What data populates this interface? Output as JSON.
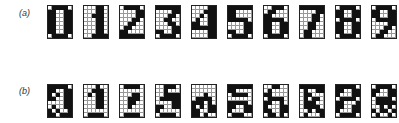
{
  "rows": [
    {
      "label": "(a)",
      "glyphs": [
        {
          "digit": "0",
          "grid": [
            "011110",
            "110011",
            "110011",
            "110011",
            "110011",
            "110011",
            "110011",
            "011110"
          ]
        },
        {
          "digit": "1",
          "grid": [
            "000110",
            "000110",
            "001110",
            "000110",
            "000110",
            "000110",
            "000110",
            "001111"
          ]
        },
        {
          "digit": "2",
          "grid": [
            "011110",
            "000011",
            "000011",
            "000110",
            "001100",
            "011000",
            "110000",
            "111111"
          ]
        },
        {
          "digit": "3",
          "grid": [
            "111111",
            "000011",
            "000110",
            "001100",
            "000110",
            "000011",
            "110011",
            "011110"
          ]
        },
        {
          "digit": "4",
          "grid": [
            "000011",
            "000111",
            "001011",
            "010011",
            "110011",
            "111111",
            "000011",
            "000011"
          ]
        },
        {
          "digit": "5",
          "grid": [
            "111111",
            "110000",
            "110000",
            "111110",
            "000011",
            "000011",
            "110011",
            "011110"
          ]
        },
        {
          "digit": "6",
          "grid": [
            "001110",
            "011000",
            "110000",
            "111110",
            "110011",
            "110011",
            "110011",
            "011110"
          ]
        },
        {
          "digit": "7",
          "grid": [
            "111111",
            "000011",
            "000110",
            "000110",
            "001100",
            "001100",
            "011000",
            "011000"
          ]
        },
        {
          "digit": "8",
          "grid": [
            "011110",
            "110011",
            "110011",
            "011110",
            "110011",
            "110011",
            "110011",
            "011110"
          ]
        },
        {
          "digit": "9",
          "grid": [
            "011110",
            "110011",
            "110011",
            "011111",
            "000011",
            "000110",
            "001100",
            "011000"
          ]
        }
      ]
    },
    {
      "label": "(b)",
      "glyphs": [
        {
          "digit": "0",
          "grid": [
            "111110",
            "110011",
            "101011",
            "110011",
            "000011",
            "010011",
            "101001",
            "110111"
          ]
        },
        {
          "digit": "1",
          "grid": [
            "000100",
            "001110",
            "010110",
            "000110",
            "000110",
            "000110",
            "000000",
            "011110"
          ]
        },
        {
          "digit": "2",
          "grid": [
            "011110",
            "000000",
            "000110",
            "001110",
            "001100",
            "001000",
            "000000",
            "011110"
          ]
        },
        {
          "digit": "3",
          "grid": [
            "001110",
            "001000",
            "001111",
            "011111",
            "000011",
            "110011",
            "100000",
            "011110"
          ]
        },
        {
          "digit": "4",
          "grid": [
            "000000",
            "000000",
            "000100",
            "011110",
            "111010",
            "101011",
            "110011",
            "110100"
          ]
        },
        {
          "digit": "5",
          "grid": [
            "111111",
            "110000",
            "011110",
            "000000",
            "111110",
            "110011",
            "100011",
            "011100"
          ]
        },
        {
          "digit": "6",
          "grid": [
            "001100",
            "010000",
            "110000",
            "011110",
            "110010",
            "100011",
            "110011",
            "011010"
          ]
        },
        {
          "digit": "7",
          "grid": [
            "111111",
            "010011",
            "011000",
            "010110",
            "011100",
            "011110",
            "001011",
            "010001"
          ]
        },
        {
          "digit": "8",
          "grid": [
            "111110",
            "110011",
            "100011",
            "011110",
            "110001",
            "110011",
            "100011",
            "011110"
          ]
        },
        {
          "digit": "9",
          "grid": [
            "011110",
            "110011",
            "100011",
            "011110",
            "011111",
            "001010",
            "101101",
            "010010"
          ]
        }
      ]
    }
  ]
}
